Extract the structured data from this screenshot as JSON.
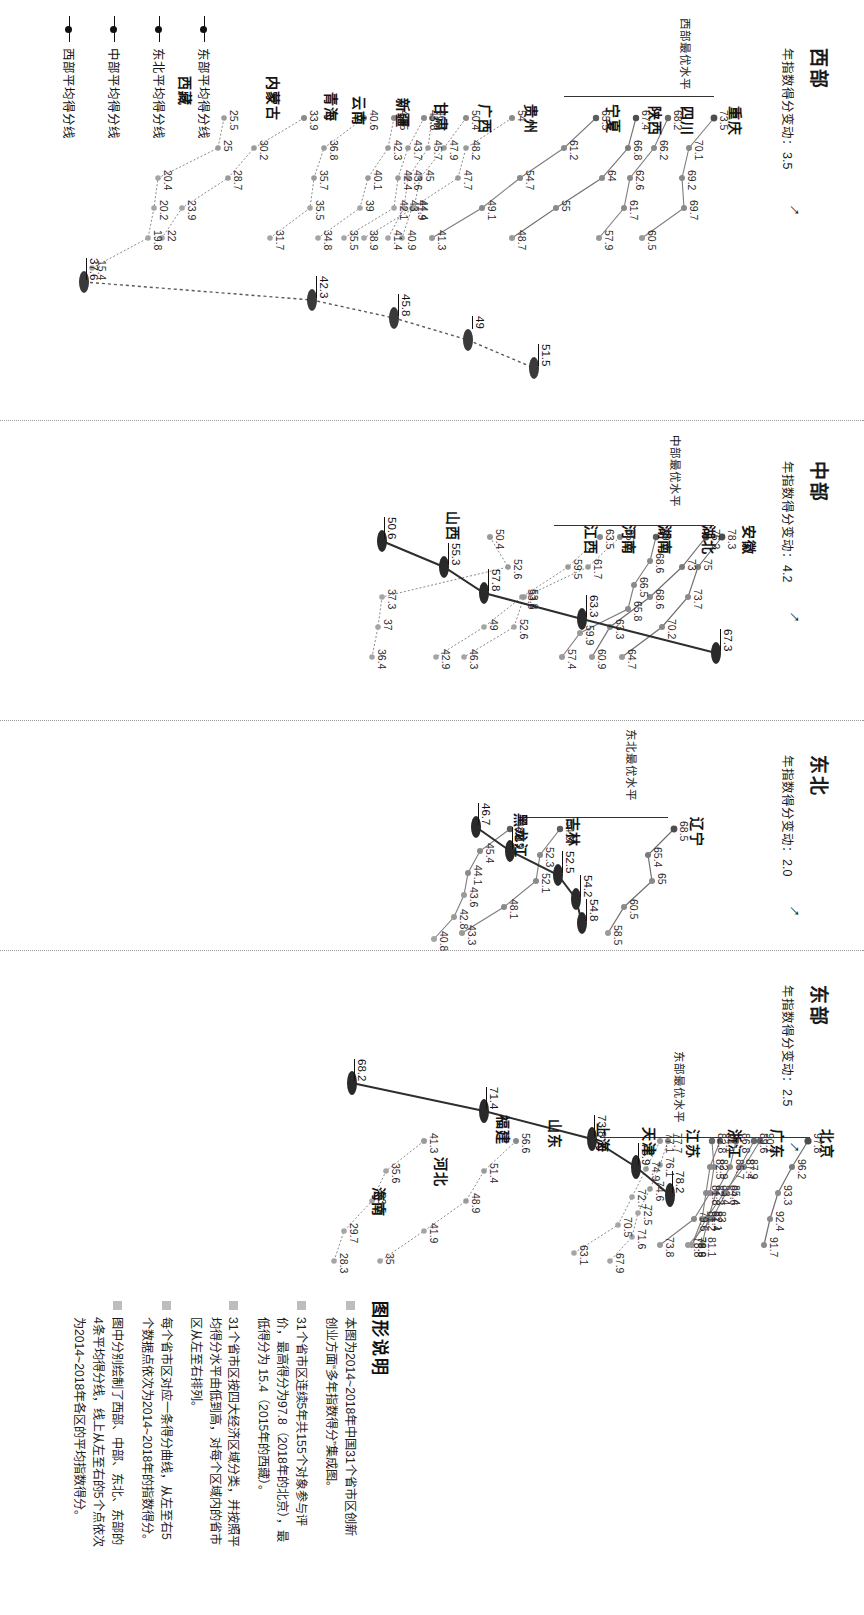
{
  "figure": {
    "legend_title": "图形说明",
    "legend_items": [
      "本图为2014~2018年中国31个省市区创新创业方面“多年指数得分”集成图。",
      "31个省市区连续5年共155个对象参与评价，最高得分为97.8（2018年的北京），最低得分为 15.4（2015年的西藏）。",
      "31个省市区按四大经济区域分类，并按照平均得分水平由低到高，对每个区域内的省市区从左至右排列。",
      "每个省市区对应一条得分曲线，从左至右5个数据点依次为2014~2018年的指数得分。",
      "图中分别绘制了西部、中部、东北、东部的4条平均得分线，线上从左至右的5个点依次为2014~2018年各区的平均指数得分。"
    ],
    "axis_keys": [
      "东部平均得分线",
      "东北平均得分线",
      "中部平均得分线",
      "西部平均得分线"
    ]
  },
  "chart_data": {
    "type": "line",
    "x": [
      "2014",
      "2015",
      "2016",
      "2017",
      "2018"
    ],
    "xlabel": "",
    "ylabel": "指数得分",
    "ylim": [
      15.4,
      97.8
    ],
    "grid": false,
    "legend_position": "right",
    "regions": [
      {
        "name": "西部",
        "subtitle": "年指数得分变动：3.5",
        "change": 3.5,
        "best_label": "西部最优水平",
        "best_value": 73.5,
        "average_label": "西部平均得分线",
        "average_values": [
          37.6,
          42.3,
          45.8,
          49.0,
          51.5
        ],
        "series": [
          {
            "name": "重庆",
            "values": [
              73.5,
              70.1,
              69.2,
              69.7,
              60.5
            ]
          },
          {
            "name": "四川",
            "values": [
              68.2,
              66.2,
              62.6,
              61.7,
              57.9
            ]
          },
          {
            "name": "陕西",
            "values": [
              67.4,
              66.8,
              64.0,
              55.0,
              48.7
            ]
          },
          {
            "name": "宁夏",
            "values": [
              65.5,
              61.2,
              54.7,
              49.1,
              41.3
            ]
          },
          {
            "name": "贵州",
            "values": [
              54.0,
              48.2,
              47.7,
              41.9,
              40.9
            ]
          },
          {
            "name": "广西",
            "values": [
              50.4,
              47.9,
              45.0,
              44.4,
              38.9
            ]
          },
          {
            "name": "甘肃",
            "values": [
              45.8,
              43.7,
              42.4,
              42.1,
              35.5
            ]
          },
          {
            "name": "新疆",
            "values": [
              46.1,
              45.7,
              43.6,
              43.0,
              41.4
            ]
          },
          {
            "name": "云南",
            "values": [
              42.5,
              42.3,
              40.1,
              39.0,
              34.8
            ]
          },
          {
            "name": "青海",
            "values": [
              40.6,
              36.8,
              35.7,
              35.5,
              31.7
            ]
          },
          {
            "name": "内蒙古",
            "values": [
              33.9,
              30.2,
              28.7,
              23.9,
              22.0
            ]
          },
          {
            "name": "西藏",
            "values": [
              25.5,
              25.0,
              20.4,
              20.2,
              19.8,
              15.4
            ]
          }
        ]
      },
      {
        "name": "中部",
        "subtitle": "年指数得分变动：4.2",
        "change": 4.2,
        "best_label": "中部最优水平",
        "best_value": 78.3,
        "average_label": "中部平均得分线",
        "average_values": [
          50.6,
          55.3,
          57.8,
          63.3,
          67.3
        ],
        "series": [
          {
            "name": "安徽",
            "values": [
              78.3,
              75.0,
              73.7,
              70.2,
              64.7
            ]
          },
          {
            "name": "湖北",
            "values": [
              76.2,
              73.0,
              68.6,
              63.3,
              60.9
            ]
          },
          {
            "name": "湖南",
            "values": [
              69.5,
              68.6,
              66.5,
              65.8,
              59.9,
              57.4
            ]
          },
          {
            "name": "河南",
            "values": [
              65.8,
              61.7,
              53.8,
              52.6,
              46.3
            ]
          },
          {
            "name": "江西",
            "values": [
              63.5,
              59.5,
              53.6,
              49.0,
              42.9
            ]
          },
          {
            "name": "山西",
            "values": [
              50.4,
              52.6,
              37.3,
              37.0,
              36.4
            ]
          }
        ]
      },
      {
        "name": "东北",
        "subtitle": "年指数得分变动：2.0",
        "change": 2.0,
        "best_label": "东北最优水平",
        "best_value": 68.5,
        "average_label": "东北平均得分线",
        "average_values": [
          46.7,
          48.9,
          52.5,
          54.2,
          54.8
        ],
        "series": [
          {
            "name": "辽宁",
            "values": [
              68.5,
              65.4,
              65.0,
              60.5,
              58.5
            ]
          },
          {
            "name": "吉林",
            "values": [
              54.8,
              52.3,
              52.1,
              48.1,
              43.3
            ]
          },
          {
            "name": "黑龙江",
            "values": [
              48.9,
              45.4,
              44.1,
              43.6,
              42.8,
              40.8
            ]
          }
        ]
      },
      {
        "name": "东部",
        "subtitle": "年指数得分变动：2.5",
        "change": 2.5,
        "best_label": "东部最优水平",
        "best_value": 97.8,
        "average_label": "东部平均得分线",
        "average_values": [
          68.2,
          71.4,
          73.8,
          75.9,
          78.2
        ],
        "series": [
          {
            "name": "北京",
            "values": [
              97.8,
              96.2,
              93.3,
              92.4,
              91.7
            ]
          },
          {
            "name": "广东",
            "values": [
              89.6,
              87.4,
              85.4,
              83.0,
              78.8
            ]
          },
          {
            "name": "浙江",
            "values": [
              90.1,
              87.9,
              84.6,
              81.4,
              78.9
            ]
          },
          {
            "name": "江苏",
            "values": [
              86.8,
              85.7,
              83.4,
              82.1,
              81.1
            ]
          },
          {
            "name": "天津",
            "values": [
              82.8,
              82.9,
              82.3,
              79.6,
              73.8
            ]
          },
          {
            "name": "上海",
            "values": [
              84.1,
              82.5,
              81.8,
              81.2,
              79.6
            ]
          },
          {
            "name": "山东",
            "values": [
              77.7,
              76.1,
              74.6,
              72.5,
              71.6,
              67.9
            ]
          },
          {
            "name": "福建",
            "values": [
              77.1,
              74.9,
              72.7,
              70.5,
              63.1
            ]
          },
          {
            "name": "河北",
            "values": [
              56.6,
              51.4,
              48.9,
              41.9,
              35.0
            ]
          },
          {
            "name": "海南",
            "values": [
              41.3,
              35.6,
              33.5,
              29.7,
              28.3
            ]
          }
        ]
      }
    ]
  }
}
